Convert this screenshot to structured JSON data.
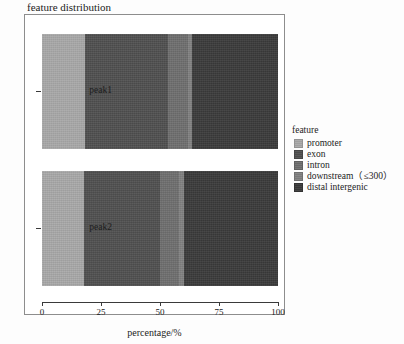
{
  "chart_data": {
    "type": "bar",
    "orientation": "horizontal-stacked",
    "title": "feature distribution",
    "xlabel": "percentage/%",
    "ylabel": "",
    "xlim": [
      0,
      100
    ],
    "xticks": [
      0,
      25,
      50,
      75,
      100
    ],
    "xticklabels": [
      "0",
      "25",
      "50",
      "75",
      "100"
    ],
    "grid": false,
    "legend": {
      "title": "feature",
      "position": "right",
      "entries": [
        {
          "label": "promoter",
          "color": "#a8a8a8"
        },
        {
          "label": "exon",
          "color": "#4f4f4f"
        },
        {
          "label": "intron",
          "color": "#6e6e6e"
        },
        {
          "label": "downstream（≤300）",
          "color": "#808080"
        },
        {
          "label": "distal intergenic",
          "color": "#3a3a3a"
        }
      ]
    },
    "categories": [
      "peak1",
      "peak2"
    ],
    "series": [
      {
        "name": "promoter",
        "color": "#a8a8a8",
        "values": [
          18.2,
          18.0
        ]
      },
      {
        "name": "exon",
        "color": "#4f4f4f",
        "values": [
          35.2,
          32.0
        ]
      },
      {
        "name": "intron",
        "color": "#6e6e6e",
        "values": [
          8.5,
          8.0
        ]
      },
      {
        "name": "downstream（≤300）",
        "color": "#808080",
        "values": [
          1.8,
          2.2
        ]
      },
      {
        "name": "distal intergenic",
        "color": "#3a3a3a",
        "values": [
          36.3,
          39.8
        ]
      }
    ]
  },
  "axis": {
    "tick_0": "0",
    "tick_25": "25",
    "tick_50": "50",
    "tick_75": "75",
    "tick_100": "100",
    "y_peak1": "peak1",
    "y_peak2": "peak2",
    "x_title": "percentage/%"
  },
  "legend_ui": {
    "title": "feature",
    "item_0": "promoter",
    "item_1": "exon",
    "item_2": "intron",
    "item_3": "downstream（≤300）",
    "item_4": "distal intergenic"
  },
  "header": {
    "title": "feature distribution"
  }
}
